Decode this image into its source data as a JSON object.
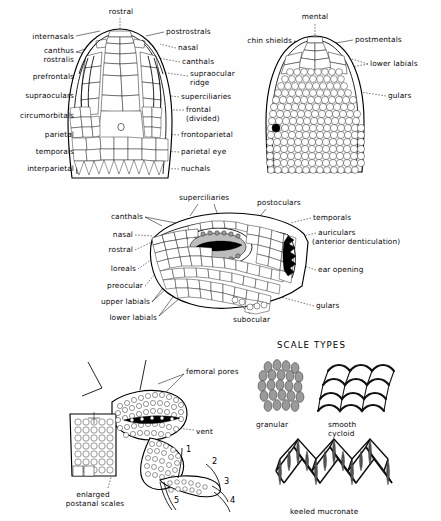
{
  "figure": {
    "panels": [
      "dorsal-head",
      "ventral-head",
      "lateral-head",
      "vent-and-hind-limb",
      "scale-types"
    ]
  },
  "dorsal_head": {
    "name": "dorsal head view",
    "labels_top": [
      "rostral"
    ],
    "labels_left": [
      "internasals",
      "canthus",
      "rostralis",
      "prefrontals",
      "supraoculars",
      "circumorbitals",
      "parietal",
      "temporals",
      "interparietal"
    ],
    "labels_right": [
      "postrostrals",
      "nasal",
      "canthals",
      "supraocular",
      "ridge",
      "superciliaries",
      "frontal",
      "(divided)",
      "frontoparietal",
      "parietal eye",
      "nuchals"
    ]
  },
  "ventral_head": {
    "name": "ventral head view",
    "labels": [
      "mental",
      "chin shields",
      "postmentals",
      "lower labials",
      "gulars"
    ]
  },
  "lateral_head": {
    "name": "lateral head view",
    "labels_top": [
      "superciliaries",
      "postoculars"
    ],
    "labels_left": [
      "canthals",
      "nasal",
      "rostral",
      "loreals",
      "preocular",
      "upper labials",
      "lower labials"
    ],
    "labels_right": [
      "temporals",
      "auriculars",
      "(anterior denticulation)",
      "ear opening",
      "gulars"
    ],
    "labels_bottom": [
      "subocular"
    ]
  },
  "vent_limb": {
    "name": "vent and hind limb",
    "labels": [
      "femoral pores",
      "vent",
      "enlarged",
      "postanal scales"
    ],
    "toe_numbers": [
      "1",
      "2",
      "3",
      "4",
      "5"
    ]
  },
  "scale_types": {
    "heading": "SCALE TYPES",
    "types": [
      {
        "label_line1": "granular",
        "label_line2": ""
      },
      {
        "label_line1": "smooth",
        "label_line2": "cycloid"
      },
      {
        "label_line1": "keeled mucronate",
        "label_line2": ""
      }
    ]
  },
  "colors": {
    "ink": "#111111",
    "paper": "#fefefe",
    "shade": "#9a9a9a",
    "black": "#000000"
  }
}
